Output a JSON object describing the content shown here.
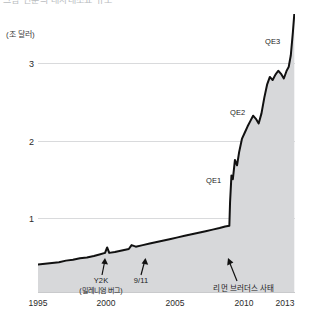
{
  "top_caption": "그림 연준의 대차대조표 규모",
  "axis": {
    "y_unit_label": "(조 달러)",
    "y_ticks": [
      "1",
      "2",
      "3"
    ],
    "x_ticks": [
      "1995",
      "2000",
      "2005",
      "2010",
      "2013"
    ]
  },
  "annotations": {
    "y2k": "Y2K",
    "y2k_sub": "(밀레니엄 버그)",
    "sept11": "9/11",
    "lehman": "리먼 브러더스 사태",
    "qe1": "QE1",
    "qe2": "QE2",
    "qe3": "QE3"
  },
  "colors": {
    "line": "#111111",
    "fill": "#d7d8da",
    "grid": "#d9dadc",
    "axis": "#c9cacc",
    "text": "#2b2b2b"
  },
  "chart_data": {
    "type": "area",
    "title": "",
    "xlabel": "",
    "ylabel": "(조 달러)",
    "xlim": [
      1995,
      2013.4
    ],
    "ylim": [
      0,
      3.8
    ],
    "grid": true,
    "legend": "none",
    "unit": "조 달러 (trillion USD)",
    "x": [
      1995.0,
      1995.5,
      1996.0,
      1996.5,
      1997.0,
      1997.5,
      1998.0,
      1998.5,
      1999.0,
      1999.4,
      1999.8,
      1999.95,
      2000.1,
      2000.5,
      2001.0,
      2001.5,
      2001.7,
      2002.0,
      2002.5,
      2003.0,
      2003.5,
      2004.0,
      2004.5,
      2005.0,
      2005.5,
      2006.0,
      2006.5,
      2007.0,
      2007.5,
      2008.0,
      2008.4,
      2008.7,
      2008.75,
      2008.85,
      2008.95,
      2009.1,
      2009.25,
      2009.4,
      2009.6,
      2009.8,
      2010.0,
      2010.2,
      2010.4,
      2010.6,
      2010.8,
      2011.0,
      2011.2,
      2011.4,
      2011.6,
      2011.8,
      2012.0,
      2012.2,
      2012.4,
      2012.6,
      2012.8,
      2012.95,
      2013.1,
      2013.25,
      2013.35
    ],
    "y": [
      0.4,
      0.41,
      0.42,
      0.43,
      0.45,
      0.46,
      0.48,
      0.49,
      0.51,
      0.53,
      0.55,
      0.62,
      0.55,
      0.56,
      0.58,
      0.6,
      0.65,
      0.63,
      0.65,
      0.67,
      0.69,
      0.71,
      0.73,
      0.75,
      0.77,
      0.79,
      0.81,
      0.83,
      0.85,
      0.87,
      0.89,
      0.9,
      1.2,
      1.55,
      1.5,
      1.75,
      1.68,
      1.85,
      2.02,
      2.1,
      2.18,
      2.25,
      2.32,
      2.28,
      2.22,
      2.35,
      2.55,
      2.72,
      2.82,
      2.78,
      2.85,
      2.9,
      2.86,
      2.8,
      2.9,
      2.95,
      3.1,
      3.4,
      3.63
    ],
    "annotated_points": [
      {
        "label": "Y2K",
        "x": 1999.95,
        "y": 0.62
      },
      {
        "label": "9/11",
        "x": 2001.7,
        "y": 0.65
      },
      {
        "label": "리먼 브러더스 사태",
        "x": 2008.75,
        "y": 0.92
      },
      {
        "label": "QE1",
        "x": 2008.95,
        "y": 1.55
      },
      {
        "label": "QE2",
        "x": 2010.8,
        "y": 2.3
      },
      {
        "label": "QE3",
        "x": 2012.95,
        "y": 3.05
      }
    ]
  }
}
